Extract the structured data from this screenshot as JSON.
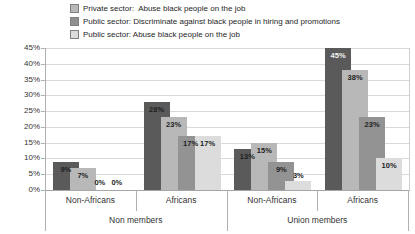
{
  "legend": {
    "items": [
      {
        "label": "Private sector:  Abuse black people on the job",
        "swatch_color": "#b8b8b8",
        "swatch_name": "private-sector-abuse-swatch",
        "pattern": true
      },
      {
        "label": "Public sector: Discriminate against black people in hiring and promotions",
        "swatch_color": "#8f8f8f",
        "swatch_name": "public-sector-discriminate-swatch",
        "pattern": false
      },
      {
        "label": "Public sector: Abuse black people on the job",
        "swatch_color": "#dcdcdc",
        "swatch_name": "public-sector-abuse-swatch",
        "pattern": false
      }
    ]
  },
  "chart_data": {
    "type": "bar",
    "title": "",
    "xlabel": "",
    "ylabel": "",
    "ylim": [
      0,
      45
    ],
    "y_tick_step": 5,
    "y_tick_labels": [
      "0%",
      "5%",
      "10%",
      "15%",
      "20%",
      "25%",
      "30%",
      "35%",
      "40%",
      "45%"
    ],
    "grid": true,
    "legend_position": "top-left",
    "series_colors": [
      "#5a5a5a",
      "#b8b8b8",
      "#939393",
      "#dcdcdc"
    ],
    "series_legend_labels": [
      null,
      "Private sector:  Abuse black people on the job",
      "Public sector: Discriminate against black people in hiring and promotions",
      "Public sector: Abuse black people on the job"
    ],
    "groups": [
      {
        "tier2": "Non members",
        "tier1": "Non-Africans",
        "values": [
          9,
          7,
          0,
          0
        ],
        "labels": [
          "9%",
          "7%",
          "0%",
          "0%"
        ]
      },
      {
        "tier2": "Non members",
        "tier1": "Africans",
        "values": [
          28,
          23,
          17,
          17
        ],
        "labels": [
          "28%",
          "23%",
          "17%",
          "17%"
        ]
      },
      {
        "tier2": "Union members",
        "tier1": "Non-Africans",
        "values": [
          13,
          15,
          9,
          3
        ],
        "labels": [
          "13%",
          "15%",
          "9%",
          "3%"
        ]
      },
      {
        "tier2": "Union members",
        "tier1": "Africans",
        "values": [
          45,
          38,
          23,
          10
        ],
        "labels": [
          "45%",
          "38%",
          "23%",
          "10%"
        ]
      }
    ],
    "tier2_labels": [
      "Non members",
      "Union members"
    ],
    "label_color_overrides": [
      {
        "group_index": 3,
        "series_index": 0,
        "color": "#f5f5f5"
      }
    ]
  },
  "colors": {
    "gridline": "#d9d9d9",
    "axis_line": "#b0b0b0",
    "text": "#262626",
    "data_label": "#1f1f1f"
  }
}
